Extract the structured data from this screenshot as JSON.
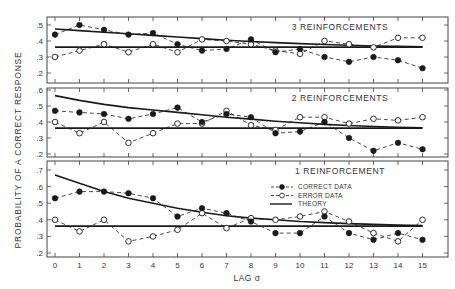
{
  "chart_data": {
    "type": "line",
    "title": "",
    "xlabel": "LAG σ",
    "ylabel": "PROBABILITY OF A CORRECT RESPONSE",
    "x": [
      0,
      1,
      2,
      3,
      4,
      5,
      6,
      7,
      8,
      9,
      10,
      11,
      12,
      13,
      14,
      15
    ],
    "x_tick_labels": [
      "0",
      "1",
      "2",
      "3",
      "4",
      "5",
      "6",
      "7",
      "8",
      "9",
      "10",
      "11",
      "12",
      "13",
      "14",
      "15"
    ],
    "legend": {
      "position": "inside bottom panel, upper right",
      "entries": [
        {
          "label": "CORRECT DATA",
          "style": "dashed line, filled circle markers"
        },
        {
          "label": "ERROR DATA",
          "style": "dashed line, open circle markers"
        },
        {
          "label": "THEORY",
          "style": "solid line"
        }
      ]
    },
    "grid": false,
    "panels": [
      {
        "title": "3 REINFORCEMENTS",
        "ylim": [
          0.2,
          0.55
        ],
        "y_ticks": [
          ".2",
          ".3",
          ".4",
          ".5"
        ],
        "series": [
          {
            "name": "CORRECT DATA",
            "values": [
              0.44,
              0.5,
              0.47,
              0.44,
              0.45,
              0.38,
              0.34,
              0.35,
              0.41,
              0.33,
              0.35,
              0.3,
              0.27,
              0.3,
              0.28,
              0.23
            ]
          },
          {
            "name": "ERROR DATA",
            "values": [
              0.3,
              0.34,
              0.38,
              0.33,
              0.38,
              0.33,
              0.41,
              0.4,
              0.38,
              0.34,
              0.32,
              0.4,
              0.38,
              0.36,
              0.42,
              0.42
            ]
          },
          {
            "name": "THEORY (decay)",
            "values": [
              0.475,
              0.465,
              0.455,
              0.445,
              0.435,
              0.425,
              0.415,
              0.405,
              0.397,
              0.39,
              0.384,
              0.378,
              0.373,
              0.369,
              0.366,
              0.364
            ]
          },
          {
            "name": "THEORY (asymptote)",
            "values": [
              0.362,
              0.362,
              0.362,
              0.362,
              0.362,
              0.362,
              0.362,
              0.362,
              0.362,
              0.362,
              0.362,
              0.362,
              0.362,
              0.362,
              0.362,
              0.362
            ]
          }
        ]
      },
      {
        "title": "2 REINFORCEMENTS",
        "ylim": [
          0.2,
          0.64
        ],
        "y_ticks": [
          ".2",
          ".3",
          ".4",
          ".5",
          ".6"
        ],
        "series": [
          {
            "name": "CORRECT DATA",
            "values": [
              0.47,
              0.46,
              0.45,
              0.42,
              0.45,
              0.49,
              0.4,
              0.45,
              0.43,
              0.33,
              0.34,
              0.4,
              0.3,
              0.22,
              0.27,
              0.23
            ]
          },
          {
            "name": "ERROR DATA",
            "values": [
              0.4,
              0.33,
              0.4,
              0.27,
              0.33,
              0.39,
              0.39,
              0.47,
              0.38,
              0.35,
              0.43,
              0.43,
              0.39,
              0.42,
              0.41,
              0.43
            ]
          },
          {
            "name": "THEORY (decay)",
            "values": [
              0.565,
              0.535,
              0.51,
              0.49,
              0.475,
              0.46,
              0.445,
              0.43,
              0.418,
              0.405,
              0.395,
              0.385,
              0.378,
              0.372,
              0.367,
              0.364
            ]
          },
          {
            "name": "THEORY (asymptote)",
            "values": [
              0.362,
              0.362,
              0.362,
              0.362,
              0.362,
              0.362,
              0.362,
              0.362,
              0.362,
              0.362,
              0.362,
              0.362,
              0.362,
              0.362,
              0.362,
              0.362
            ]
          }
        ]
      },
      {
        "title": "1 REINFORCEMENT",
        "ylim": [
          0.2,
          0.74
        ],
        "y_ticks": [
          ".2",
          ".3",
          ".4",
          ".5",
          ".6",
          ".7"
        ],
        "series": [
          {
            "name": "CORRECT DATA",
            "values": [
              0.53,
              0.57,
              0.57,
              0.56,
              0.53,
              0.42,
              0.47,
              0.44,
              0.39,
              0.32,
              0.32,
              0.42,
              0.32,
              0.28,
              0.32,
              0.28
            ]
          },
          {
            "name": "ERROR DATA",
            "values": [
              0.4,
              0.33,
              0.4,
              0.27,
              0.3,
              0.34,
              0.44,
              0.35,
              0.41,
              0.4,
              0.42,
              0.45,
              0.39,
              0.32,
              0.27,
              0.4
            ]
          },
          {
            "name": "THEORY (decay)",
            "values": [
              0.67,
              0.62,
              0.57,
              0.53,
              0.5,
              0.47,
              0.445,
              0.425,
              0.41,
              0.4,
              0.39,
              0.383,
              0.377,
              0.372,
              0.368,
              0.365
            ]
          },
          {
            "name": "THEORY (asymptote)",
            "values": [
              0.362,
              0.362,
              0.362,
              0.362,
              0.362,
              0.362,
              0.362,
              0.362,
              0.362,
              0.362,
              0.362,
              0.362,
              0.362,
              0.362,
              0.362,
              0.362
            ]
          }
        ]
      }
    ]
  },
  "layout": {
    "frame_left": 47,
    "frame_right": 448,
    "x0_px": 55,
    "x_step_px": 24.5,
    "panels_px": [
      {
        "top": 17,
        "bottom": 83,
        "ymin": 0.2,
        "ymin_px": 73,
        "px_per_unit": 160
      },
      {
        "top": 88,
        "bottom": 157,
        "ymin": 0.2,
        "ymin_px": 154,
        "px_per_unit": 160
      },
      {
        "top": 161,
        "bottom": 257,
        "ymin": 0.2,
        "ymin_px": 253,
        "px_per_unit": 166
      }
    ],
    "colors": {
      "ink": "#1a1a1a",
      "frame": "#444444",
      "background": "#ffffff"
    }
  }
}
